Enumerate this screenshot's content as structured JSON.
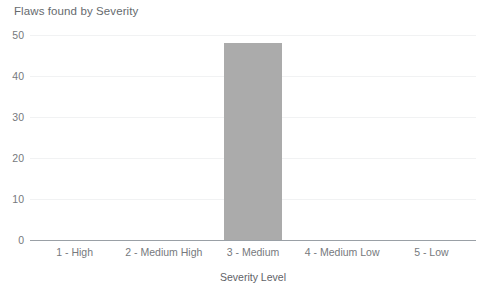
{
  "chart_data": {
    "type": "bar",
    "title": "Flaws found by Severity",
    "xlabel": "Severity Level",
    "ylabel": "",
    "categories": [
      "1 - High",
      "2 - Medium High",
      "3 - Medium",
      "4 - Medium Low",
      "5 - Low"
    ],
    "values": [
      0,
      0,
      48,
      0,
      0
    ],
    "ylim": [
      0,
      50
    ],
    "yticks": [
      0,
      10,
      20,
      30,
      40,
      50
    ],
    "ytick_labels": [
      "0",
      "10",
      "20",
      "30",
      "40",
      "50"
    ],
    "grid": true,
    "legend": false,
    "legend_position": "none",
    "series": [
      {
        "name": "Flaws found",
        "values": [
          0,
          0,
          48,
          0,
          0
        ],
        "color": "#ababab"
      }
    ],
    "colors": {
      "bar": "#ababab",
      "gridline": "#f1f2f3",
      "axis": "#9aa0a6",
      "title_text": "#666a6e",
      "tick_text": "#76797d",
      "background": "#ffffff"
    }
  }
}
